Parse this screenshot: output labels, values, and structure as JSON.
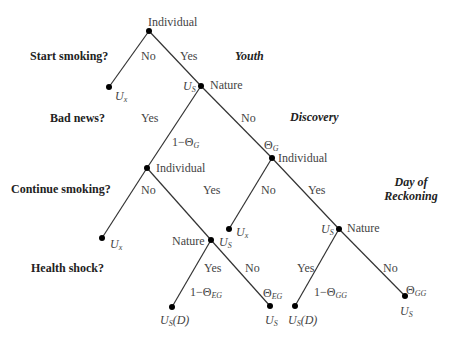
{
  "questions": [
    {
      "label": "Start smoking?"
    },
    {
      "label": "Bad news?"
    },
    {
      "label": "Continue smoking?"
    },
    {
      "label": "Health shock?"
    }
  ],
  "stages": [
    {
      "label": "Youth"
    },
    {
      "label": "Discovery"
    },
    {
      "label": "Day of Reckoning"
    }
  ],
  "nodes": {
    "root": {
      "label": "Individual"
    },
    "nature_1": {
      "label": "Nature",
      "payoff": "U",
      "payoff_sub": "S"
    },
    "ind_left": {
      "label": "Individual"
    },
    "ind_right": {
      "label": "Individual"
    },
    "nature_left": {
      "label": "Nature",
      "payoff": "U",
      "payoff_sub": "S"
    },
    "nature_right": {
      "label": "Nature",
      "payoff": "U",
      "payoff_sub": "S"
    }
  },
  "leaves": {
    "ux_1": {
      "main": "U",
      "sub": "x"
    },
    "ux_2": {
      "main": "U",
      "sub": "x"
    },
    "ux_3": {
      "main": "U",
      "sub": "x"
    },
    "usd_1": {
      "main": "U",
      "sub": "S",
      "suffix": "(D)"
    },
    "us_1": {
      "main": "U",
      "sub": "S"
    },
    "usd_2": {
      "main": "U",
      "sub": "S",
      "suffix": "(D)"
    },
    "us_2": {
      "main": "U",
      "sub": "S"
    }
  },
  "edges": {
    "root_no": "No",
    "root_yes": "Yes",
    "nature1_yes": "Yes",
    "nature1_no": "No",
    "nature1_yes_prob": "1−Θ",
    "nature1_yes_prob_sub": "G",
    "nature1_no_prob": "Θ",
    "nature1_no_prob_sub": "G",
    "indleft_no": "No",
    "indleft_yes": "Yes",
    "indright_no": "No",
    "indright_yes": "Yes",
    "natleft_yes": "Yes",
    "natleft_no": "No",
    "natleft_yes_prob": "1−Θ",
    "natleft_yes_prob_sub": "EG",
    "natleft_no_prob": "Θ",
    "natleft_no_prob_sub": "EG",
    "natright_yes": "Yes",
    "natright_no": "No",
    "natright_yes_prob": "1−Θ",
    "natright_yes_prob_sub": "GG",
    "natright_no_prob": "Θ",
    "natright_no_prob_sub": "GG"
  }
}
